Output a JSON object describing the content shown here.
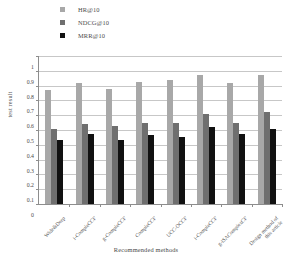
{
  "chart_data": {
    "type": "bar",
    "title": "",
    "xlabel": "Recommended methods",
    "ylabel": "test result",
    "ylim": [
      0,
      1
    ],
    "ytick_labels": [
      "1",
      "0.9",
      "0.8",
      "0.7",
      "0.6",
      "0.5",
      "0.4",
      "0.3",
      "0.2",
      "0.1",
      "0"
    ],
    "ytick_values": [
      1,
      0.9,
      0.8,
      0.7,
      0.6,
      0.5,
      0.4,
      0.3,
      0.2,
      0.1,
      0
    ],
    "grid": true,
    "legend_position": "top-left",
    "categories": [
      "Wide&Deep",
      "i-CompleCCF",
      "g-CompleCCF",
      "CompleCCF",
      "UCC-OCCF",
      "i-CompleCCF",
      "g-iSAComplexCF",
      "Design method of this article"
    ],
    "series": [
      {
        "name": "HR@10",
        "color": "#a8a8a8",
        "values": [
          0.77,
          0.82,
          0.78,
          0.825,
          0.835,
          0.87,
          0.82,
          0.875
        ]
      },
      {
        "name": "NDCG@10",
        "color": "#6f6f6f",
        "values": [
          0.51,
          0.54,
          0.525,
          0.545,
          0.55,
          0.605,
          0.545,
          0.62
        ]
      },
      {
        "name": "MRR@10",
        "color": "#111111",
        "values": [
          0.43,
          0.47,
          0.43,
          0.465,
          0.455,
          0.52,
          0.475,
          0.51
        ]
      }
    ]
  },
  "legend": {
    "items": [
      {
        "label": "HR@10",
        "color": "#a8a8a8"
      },
      {
        "label": "NDCG@10",
        "color": "#6f6f6f"
      },
      {
        "label": "MRR@10",
        "color": "#111111"
      }
    ]
  },
  "axis": {
    "x_title": "Recommended methods",
    "y_title": "test result"
  }
}
